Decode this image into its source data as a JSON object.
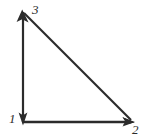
{
  "diagram": {
    "kind": "right-triangle-vector-diagram",
    "background_color": "#ffffff",
    "stroke_color": "#2b2b2b",
    "stroke_width": 2.2,
    "canvas": {
      "width": 157,
      "height": 140
    },
    "vertices": [
      {
        "id": "1",
        "label": "1",
        "x": 23,
        "y": 122,
        "label_x": 9,
        "label_y": 112,
        "label_position": "left"
      },
      {
        "id": "2",
        "label": "2",
        "x": 134,
        "y": 122,
        "label_x": 132,
        "label_y": 123,
        "label_position": "below"
      },
      {
        "id": "3",
        "label": "3",
        "x": 23,
        "y": 12,
        "label_x": 32,
        "label_y": 3,
        "label_position": "upper-right"
      }
    ],
    "edges": [
      {
        "name": "leg-vertical",
        "from": "1",
        "to": "3",
        "x1": 23,
        "y1": 122,
        "x2": 23,
        "y2": 12,
        "arrow_at_start": true,
        "arrow_at_end": true,
        "arrow_start_direction": "down",
        "arrow_end_direction": "up"
      },
      {
        "name": "leg-horizontal",
        "from": "1",
        "to": "2",
        "x1": 23,
        "y1": 122,
        "x2": 134,
        "y2": 122,
        "arrow_at_start": false,
        "arrow_at_end": true,
        "arrow_end_direction": "right"
      },
      {
        "name": "hypotenuse",
        "from": "3",
        "to": "2",
        "x1": 23,
        "y1": 12,
        "x2": 134,
        "y2": 122,
        "arrow_at_start": false,
        "arrow_at_end": true,
        "arrow_end_direction": "down-right"
      }
    ]
  }
}
